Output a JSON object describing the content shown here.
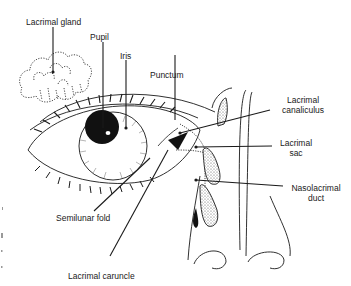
{
  "diagram": {
    "colors": {
      "ink": "#1a1a1a",
      "background": "#ffffff",
      "stipple": "#8a8a8a"
    },
    "labels": {
      "lacrimal_gland": "Lacrimal gland",
      "pupil": "Pupil",
      "iris": "Iris",
      "punctum": "Punctum",
      "lacrimal_canaliculus_1": "Lacrimal",
      "lacrimal_canaliculus_2": "canaliculus",
      "lacrimal_sac_1": "Lacrimal",
      "lacrimal_sac_2": "sac",
      "nasolacrimal_duct_1": "Nasolacrimal",
      "nasolacrimal_duct_2": "duct",
      "semilunar_fold": "Semilunar fold",
      "lacrimal_caruncle": "Lacrimal caruncle"
    }
  }
}
